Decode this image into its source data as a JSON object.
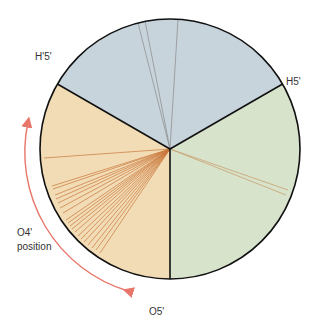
{
  "diagram": {
    "type": "conformation-wheel",
    "center": [
      170,
      149
    ],
    "radius": 130,
    "sectors": [
      {
        "name": "top",
        "color": "#c8d4dc",
        "between": [
          "H'5'",
          "H5'"
        ]
      },
      {
        "name": "right",
        "color": "#d8e3cc",
        "between": [
          "H5'",
          "O5'"
        ]
      },
      {
        "name": "left",
        "color": "#f2dcb6",
        "between": [
          "O5'",
          "H'5'"
        ]
      }
    ],
    "divider_color": "#111111",
    "line_color_gray": "#8a8a8a",
    "line_color_orange": "#c8763a",
    "arrow_color": "#e8766a"
  },
  "labels": {
    "h5prime_prime": "H'5'",
    "h5prime": "H5'",
    "o4_line1": "O4'",
    "o4_line2": "position",
    "o5prime": "O5'"
  }
}
